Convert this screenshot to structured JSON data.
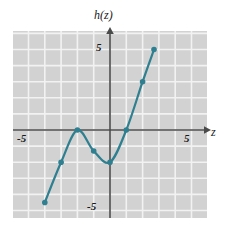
{
  "chart_data": {
    "type": "line",
    "title": "",
    "xlabel": "z",
    "ylabel": "h(z)",
    "function_label": "h(z)",
    "xlim": [
      -6,
      6
    ],
    "ylim": [
      -6,
      6
    ],
    "grid": true,
    "grid_step": 1,
    "legend": "none",
    "x_tick_labels": [
      "-5",
      "5"
    ],
    "x_tick_values": [
      -5,
      5
    ],
    "y_tick_labels": [
      "5",
      "-5"
    ],
    "y_tick_values": [
      5,
      -5
    ],
    "series": [
      {
        "name": "h(z)",
        "color": "#2e7f8f",
        "marker": "circle",
        "x": [
          -4,
          -3,
          -2,
          -1,
          0,
          1,
          2,
          2.7
        ],
        "y": [
          -4.5,
          -2,
          0,
          -1.3,
          -2,
          0,
          3,
          5
        ],
        "points": [
          {
            "x": -4,
            "y": -4.5
          },
          {
            "x": -3,
            "y": -2
          },
          {
            "x": -2,
            "y": 0
          },
          {
            "x": -1,
            "y": -1.3
          },
          {
            "x": 0,
            "y": -2
          },
          {
            "x": 1,
            "y": 0
          },
          {
            "x": 2,
            "y": 3
          },
          {
            "x": 2.7,
            "y": 5
          }
        ]
      }
    ],
    "colors": {
      "curve": "#2e7f8f",
      "plot_background": "#d2d2d2",
      "grid_line": "#f2f2f2",
      "axis": "#4a4a4a",
      "text": "#1a1a1a",
      "page_background": "#ffffff"
    },
    "plot_area_px": {
      "left": 13,
      "top": 31,
      "width": 194,
      "height": 187
    },
    "origin_px": {
      "x": 110,
      "y": 130
    },
    "unit_px": {
      "x": 16.3,
      "y": 16.1
    }
  },
  "labels": {
    "y_axis_name": "h(z)",
    "x_axis_name": "z",
    "y_tick_top": "5",
    "y_tick_bottom": "-5",
    "x_tick_left": "-5",
    "x_tick_right": "5"
  }
}
